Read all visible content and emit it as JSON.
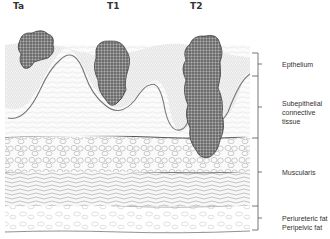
{
  "figure": {
    "stages": [
      {
        "label": "Ta",
        "x": 16
      },
      {
        "label": "T1",
        "x": 110
      },
      {
        "label": "T2",
        "x": 193
      }
    ],
    "layers": [
      {
        "label": "Epthelium",
        "label_y": 30,
        "bracket_top": 53,
        "bracket_bottom": 76
      },
      {
        "label": "Subepithelial connective tissue",
        "line1": "Subepithelial",
        "line2": "connective tissue",
        "label_y": 103,
        "bracket_top": 76,
        "bracket_bottom": 138
      },
      {
        "label": "Muscularis",
        "label_y": 167,
        "bracket_top": 138,
        "bracket_bottom": 206
      },
      {
        "label": "Periureteric fat Peripelvic fat",
        "line1": "Periureteric fat",
        "line2": "Peripelvic fat",
        "label_y": 216,
        "bracket_top": 206,
        "bracket_bottom": 230
      }
    ],
    "colors": {
      "line": "#555555",
      "tumor": "#6a6a6a",
      "tumor_dark": "#3a3a3a",
      "tissue_light": "#bdbdbd"
    }
  }
}
